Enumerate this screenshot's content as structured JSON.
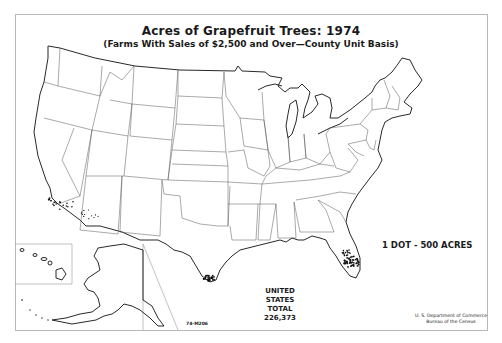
{
  "map": {
    "title": "Acres of Grapefruit Trees: 1974",
    "subtitle": "(Farms With Sales of $2,500 and Over—County Unit Basis)",
    "legend": "1 DOT - 500 ACRES",
    "total": {
      "line1": "UNITED STATES",
      "line2": "TOTAL",
      "value": "226,373"
    },
    "map_code": "74-M206",
    "credit": {
      "line1": "U. S. Department of Commerce",
      "line2": "Bureau of the Census"
    },
    "ink_color": "#111111",
    "dot_value_acres": 500,
    "dot_regions": [
      {
        "name": "Florida",
        "density": "high"
      },
      {
        "name": "Texas (Lower Rio Grande Valley)",
        "density": "high"
      },
      {
        "name": "California (southern)",
        "density": "medium"
      },
      {
        "name": "Arizona",
        "density": "low"
      }
    ],
    "insets": [
      "Alaska",
      "Hawaii"
    ]
  }
}
